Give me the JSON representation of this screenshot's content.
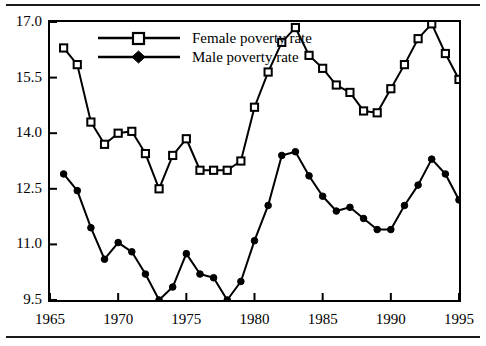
{
  "figure": {
    "background_color": "#ffffff",
    "line_color": "#000000",
    "rule_top": "horizontal-rule",
    "rule_bottom": "horizontal-rule"
  },
  "legend": {
    "position": "top-center-left",
    "entries": [
      {
        "label": "Female poverty rate",
        "marker": "open-square",
        "icon": "open-square-marker-icon"
      },
      {
        "label": "Male poverty rate",
        "marker": "filled-diamond",
        "icon": "filled-diamond-marker-icon"
      }
    ]
  },
  "axes": {
    "y_ticks": [
      "9.5",
      "11.0",
      "12.5",
      "14.0",
      "15.5",
      "17.0"
    ],
    "y_tick_values": [
      9.5,
      11.0,
      12.5,
      14.0,
      15.5,
      17.0
    ],
    "x_ticks": [
      "1965",
      "1970",
      "1975",
      "1980",
      "1985",
      "1990",
      "1995"
    ],
    "x_tick_values": [
      1965,
      1970,
      1975,
      1980,
      1985,
      1990,
      1995
    ]
  },
  "chart_data": {
    "type": "line",
    "title": "",
    "subtitle": "",
    "xlabel": "",
    "ylabel": "",
    "xlim": [
      1965,
      1995
    ],
    "ylim": [
      9.5,
      17.0
    ],
    "grid": false,
    "legend_position": "upper-center-left",
    "x": [
      1966,
      1967,
      1968,
      1969,
      1970,
      1971,
      1972,
      1973,
      1974,
      1975,
      1976,
      1977,
      1978,
      1979,
      1980,
      1981,
      1982,
      1983,
      1984,
      1985,
      1986,
      1987,
      1988,
      1989,
      1990,
      1991,
      1992,
      1993,
      1994,
      1995
    ],
    "series": [
      {
        "name": "Female poverty rate",
        "marker": "open-square",
        "values": [
          16.3,
          15.85,
          14.3,
          13.7,
          14.0,
          14.05,
          13.45,
          12.5,
          13.4,
          13.85,
          13.0,
          13.0,
          13.0,
          13.25,
          14.7,
          15.65,
          16.45,
          16.85,
          16.1,
          15.75,
          15.3,
          15.1,
          14.6,
          14.55,
          15.2,
          15.85,
          16.55,
          16.95,
          16.15,
          15.45
        ]
      },
      {
        "name": "Male poverty rate",
        "marker": "filled-diamond",
        "values": [
          12.9,
          12.45,
          11.45,
          10.6,
          11.05,
          10.8,
          10.2,
          9.5,
          9.85,
          10.75,
          10.2,
          10.1,
          9.5,
          10.0,
          11.1,
          12.05,
          13.4,
          13.5,
          12.85,
          12.3,
          11.9,
          12.0,
          11.7,
          11.4,
          11.4,
          12.05,
          12.6,
          13.3,
          12.9,
          12.2
        ]
      }
    ]
  }
}
